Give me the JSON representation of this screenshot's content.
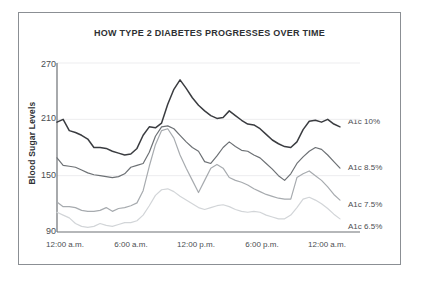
{
  "chart_data": {
    "type": "line",
    "title": "HOW TYPE 2 DIABETES PROGRESSES OVER TIME",
    "xlabel": "",
    "ylabel": "Blood Sugar Levels",
    "ylim": [
      90,
      270
    ],
    "yticks": [
      90,
      150,
      210,
      270
    ],
    "xticks": [
      "12:00 a.m.",
      "6:00 a.m.",
      "12:00 p.m.",
      "6:00 p.m.",
      "12:00 a.m."
    ],
    "xlim_hours": [
      0,
      24
    ],
    "grid": true,
    "grid_axis": "y",
    "legend_position": "right-inline",
    "x": [
      0,
      0.5,
      1,
      1.5,
      2,
      2.5,
      3,
      3.5,
      4,
      4.5,
      5,
      5.5,
      6,
      6.5,
      7,
      7.5,
      8,
      8.5,
      9,
      9.5,
      10,
      10.5,
      11,
      11.5,
      12,
      12.5,
      13,
      13.5,
      14,
      14.5,
      15,
      15.5,
      16,
      16.5,
      17,
      17.5,
      18,
      18.5,
      19,
      19.5,
      20,
      20.5,
      21,
      21.5,
      22,
      22.5,
      23
    ],
    "series": [
      {
        "name": "A1c 10%",
        "color": "#3a3c40",
        "values": [
          207,
          210,
          198,
          196,
          193,
          189,
          180,
          180,
          179,
          176,
          174,
          172,
          173,
          179,
          193,
          202,
          201,
          206,
          226,
          242,
          252,
          243,
          233,
          225,
          219,
          214,
          211,
          212,
          219,
          214,
          209,
          205,
          204,
          200,
          194,
          188,
          184,
          181,
          180,
          186,
          199,
          208,
          209,
          207,
          210,
          205,
          202
        ]
      },
      {
        "name": "A1c 8.5%",
        "color": "#6d7175",
        "values": [
          169,
          161,
          160,
          159,
          156,
          153,
          151,
          150,
          149,
          148,
          149,
          152,
          159,
          161,
          163,
          175,
          192,
          202,
          203,
          200,
          193,
          186,
          180,
          176,
          165,
          163,
          171,
          180,
          186,
          181,
          177,
          176,
          172,
          169,
          163,
          157,
          150,
          145,
          152,
          163,
          170,
          176,
          180,
          178,
          172,
          165,
          158
        ]
      },
      {
        "name": "A1c 7.5%",
        "color": "#a7abaf",
        "values": [
          122,
          117,
          117,
          116,
          113,
          112,
          112,
          113,
          116,
          112,
          115,
          116,
          118,
          121,
          134,
          160,
          183,
          198,
          200,
          190,
          172,
          158,
          145,
          132,
          145,
          158,
          162,
          158,
          148,
          145,
          143,
          140,
          136,
          133,
          130,
          128,
          126,
          125,
          125,
          148,
          152,
          155,
          150,
          145,
          138,
          130,
          124
        ]
      },
      {
        "name": "A1c 6.5%",
        "color": "#d2d5d8",
        "values": [
          111,
          108,
          105,
          99,
          96,
          95,
          96,
          99,
          97,
          96,
          98,
          100,
          100,
          102,
          108,
          118,
          129,
          135,
          136,
          133,
          128,
          124,
          120,
          116,
          114,
          116,
          118,
          119,
          117,
          114,
          112,
          111,
          112,
          111,
          108,
          106,
          104,
          104,
          108,
          116,
          125,
          127,
          124,
          120,
          115,
          109,
          104
        ]
      }
    ]
  },
  "styling": {
    "axis_color": "#6d7175",
    "grid_color": "#ededef",
    "frame_color": "#8b8f94",
    "text_color": "#2e3033",
    "tick_text_color": "#4a4d51",
    "background": "#ffffff"
  }
}
